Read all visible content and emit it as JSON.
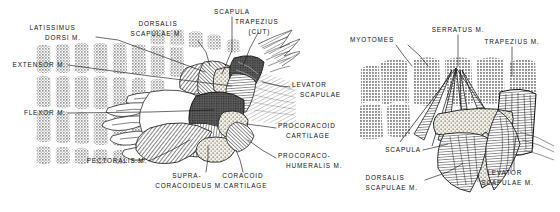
{
  "figure": {
    "background_color": "#ffffff",
    "ink_color": "#111111",
    "myotome_tone": "#a8a8a8",
    "muscle_tone": "#6e6e6e",
    "cartilage_stipple": "#e8e4d8",
    "panels": [
      {
        "id": "left-panel",
        "name": "left-dissection",
        "labels": [
          {
            "id": "latissimus",
            "lines": [
              "LATISSIMUS",
              "DORSI M."
            ],
            "anchor": "end",
            "x": 94,
            "y": 34,
            "line_height": 9.5,
            "leader": [
              [
                96,
                37
              ],
              [
                118,
                40
              ],
              [
                205,
                72
              ]
            ]
          },
          {
            "id": "dorsalis-scapulae",
            "lines": [
              "DORSALIS",
              "SCAPULAE M."
            ],
            "anchor": "end",
            "x": 196,
            "y": 30,
            "line_height": 9.5,
            "leader": [
              [
                198,
                41
              ],
              [
                206,
                52
              ],
              [
                210,
                66
              ]
            ]
          },
          {
            "id": "scapula",
            "lines": [
              "SCAPULA"
            ],
            "anchor": "middle",
            "x": 232,
            "y": 14,
            "line_height": 9.5,
            "leader": [
              [
                232,
                17
              ],
              [
                232,
                50
              ],
              [
                222,
                74
              ]
            ]
          },
          {
            "id": "trapezius-cut",
            "lines": [
              "TRAPEZIUS",
              "(CUT)"
            ],
            "anchor": "middle",
            "x": 266,
            "y": 26,
            "line_height": 9.5,
            "leader": [
              [
                258,
                33
              ],
              [
                250,
                48
              ],
              [
                243,
                66
              ]
            ]
          },
          {
            "id": "extensor",
            "lines": [
              "EXTENSOR M."
            ],
            "anchor": "end",
            "x": 66,
            "y": 67,
            "line_height": 9.5,
            "leader": [
              [
                68,
                65
              ],
              [
                150,
                76
              ],
              [
                232,
                86
              ]
            ]
          },
          {
            "id": "flexor",
            "lines": [
              "FLEXOR M."
            ],
            "anchor": "end",
            "x": 66,
            "y": 115,
            "line_height": 9.5,
            "leader": [
              [
                68,
                113
              ],
              [
                150,
                112
              ],
              [
                214,
                110
              ]
            ]
          },
          {
            "id": "levator-scapulae",
            "lines": [
              "LEVATOR",
              "SCAPULAE"
            ],
            "anchor": "start",
            "x": 292,
            "y": 89,
            "line_height": 9.5,
            "leader": [
              [
                290,
                87
              ],
              [
                280,
                86
              ],
              [
                262,
                82
              ]
            ]
          },
          {
            "id": "procoracoid-cartilage",
            "lines": [
              "PROCORACOID",
              "CARTILAGE"
            ],
            "anchor": "start",
            "x": 278,
            "y": 130,
            "line_height": 9.5,
            "leader": [
              [
                276,
                128
              ],
              [
                262,
                126
              ],
              [
                246,
                124
              ]
            ]
          },
          {
            "id": "procoraco-humeralis",
            "lines": [
              "PROCORACO-",
              "HUMERALIS M."
            ],
            "anchor": "start",
            "x": 278,
            "y": 160,
            "line_height": 9.5,
            "leader": [
              [
                276,
                158
              ],
              [
                262,
                150
              ],
              [
                248,
                140
              ]
            ]
          },
          {
            "id": "pectoralis",
            "lines": [
              "PECTORALIS M."
            ],
            "anchor": "end",
            "x": 147,
            "y": 163,
            "line_height": 9.5,
            "leader": [
              [
                149,
                161
              ],
              [
                172,
                150
              ],
              [
                190,
                140
              ]
            ]
          },
          {
            "id": "supracoracoideus",
            "lines": [
              "SUPRA-",
              "CORACOIDEUS M."
            ],
            "anchor": "middle",
            "x": 196,
            "y": 180,
            "line_height": 9.5,
            "leader": [
              [
                206,
                172
              ],
              [
                208,
                158
              ],
              [
                208,
                146
              ]
            ]
          },
          {
            "id": "coracoid-cartilage",
            "lines": [
              "CORACOID",
              "CARTILAGE"
            ],
            "anchor": "middle",
            "x": 250,
            "y": 180,
            "line_height": 9.5,
            "leader": [
              [
                243,
                172
              ],
              [
                240,
                160
              ],
              [
                236,
                150
              ]
            ]
          }
        ]
      },
      {
        "id": "right-panel",
        "name": "right-dissection",
        "labels": [
          {
            "id": "myotomes",
            "lines": [
              "MYOTOMES"
            ],
            "anchor": "end",
            "x": 408,
            "y": 42,
            "line_height": 9.5,
            "leader": [
              [
                396,
                45
              ],
              [
                404,
                56
              ],
              [
                412,
                66
              ]
            ],
            "leader2": [
              [
                408,
                45
              ],
              [
                420,
                56
              ],
              [
                428,
                66
              ]
            ]
          },
          {
            "id": "serratus",
            "lines": [
              "SERRATUS M."
            ],
            "anchor": "middle",
            "x": 458,
            "y": 32,
            "line_height": 9.5,
            "leader": [
              [
                458,
                35
              ],
              [
                458,
                48
              ],
              [
                458,
                66
              ]
            ]
          },
          {
            "id": "trapezius",
            "lines": [
              "TRAPEZIUS M."
            ],
            "anchor": "middle",
            "x": 512,
            "y": 44,
            "line_height": 9.5,
            "leader": [
              [
                512,
                47
              ],
              [
                512,
                62
              ],
              [
                512,
                76
              ]
            ]
          },
          {
            "id": "scapula-right",
            "lines": [
              "SCAPULA"
            ],
            "anchor": "end",
            "x": 421,
            "y": 152,
            "line_height": 9.5,
            "leader": [
              [
                423,
                150
              ],
              [
                436,
                147
              ],
              [
                448,
                144
              ]
            ]
          },
          {
            "id": "dorsalis-scapulae-right",
            "lines": [
              "DORSALIS",
              "SCAPULAE M."
            ],
            "anchor": "end",
            "x": 423,
            "y": 182,
            "line_height": 9.5,
            "leader": [
              [
                425,
                180
              ],
              [
                448,
                172
              ],
              [
                462,
                164
              ]
            ]
          },
          {
            "id": "levator-scapulae-right",
            "lines": [
              "LEVATOR",
              "SCAPULAE M."
            ],
            "anchor": "middle",
            "x": 514,
            "y": 177,
            "line_height": 9.5,
            "leader": [
              [
                514,
                170
              ],
              [
                514,
                152
              ],
              [
                516,
                136
              ]
            ]
          }
        ]
      }
    ]
  }
}
